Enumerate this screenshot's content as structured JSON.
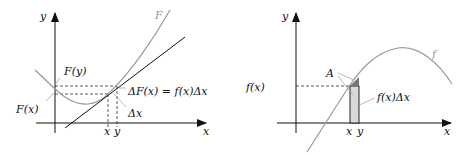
{
  "left": {
    "axis_x": "x",
    "axis_y": "y",
    "curve_label": "F",
    "label_Fy": "F(y)",
    "label_Fx": "F(x)",
    "label_dF": "ΔF(x) = f(x)Δx",
    "label_dx": "Δx",
    "tick_x": "x",
    "tick_y": "y"
  },
  "right": {
    "axis_x": "x",
    "axis_y": "y",
    "curve_label": "f",
    "label_fx": "f(x)",
    "label_A": "A",
    "label_area": "f(x)Δx",
    "tick_x": "x",
    "tick_y": "y"
  },
  "colors": {
    "axis": "#111111",
    "curve": "#999999",
    "rect_fill": "#d9d9d9",
    "triangle_fill": "#777777"
  }
}
